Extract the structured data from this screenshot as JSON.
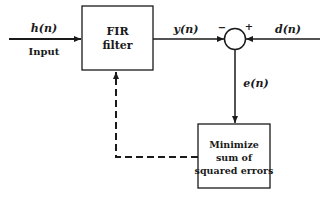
{
  "diagram": {
    "input": {
      "signal": "h(n)",
      "caption": "Input"
    },
    "fir_block": {
      "line1": "FIR",
      "line2": "filter"
    },
    "output_signal": "y(n)",
    "summer": {
      "minus_sign": "−",
      "plus_sign": "+"
    },
    "desired_signal": "d(n)",
    "error_signal": "e(n)",
    "minimize_block": {
      "line1": "Minimize",
      "line2": "sum of",
      "line3": "squared errors"
    },
    "colors": {
      "stroke": "#1a1a1a",
      "background": "#ffffff"
    }
  }
}
